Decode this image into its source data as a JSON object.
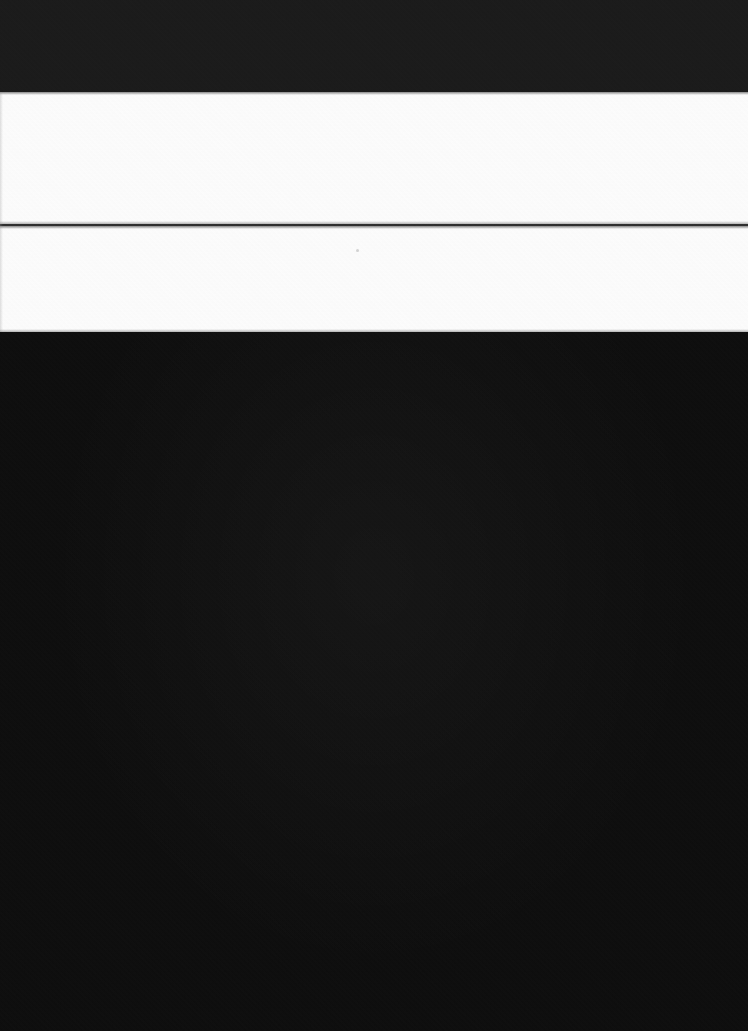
{
  "screen": {
    "state_label": "",
    "width": 748,
    "height": 1031,
    "description": "",
    "colors": {
      "top_band": "#1a1a1a",
      "white_band": "#fdfdfd",
      "divider_rule": "#2e2e2e",
      "main_surface": "#0d0d0d",
      "page_background": "#000000"
    }
  },
  "bands": {
    "top_dark": {
      "label": "",
      "y": 0,
      "height": 92,
      "color": "#1a1a1a"
    },
    "white_upper": {
      "label": "",
      "y": 92,
      "height": 132,
      "color": "#fdfdfd"
    },
    "divider": {
      "label": "",
      "y": 224,
      "height": 2,
      "color": "#2e2e2e"
    },
    "white_lower": {
      "label": "",
      "y": 226,
      "height": 106,
      "color": "#fdfdfd"
    },
    "bottom_dark": {
      "label": "",
      "y": 332,
      "height": 699,
      "color": "#0d0d0d"
    }
  },
  "artifacts": {
    "speck": {
      "label": "",
      "x": 356,
      "y": 249
    },
    "edge_sliver": {
      "label": "",
      "x": 0,
      "y": 92
    }
  }
}
